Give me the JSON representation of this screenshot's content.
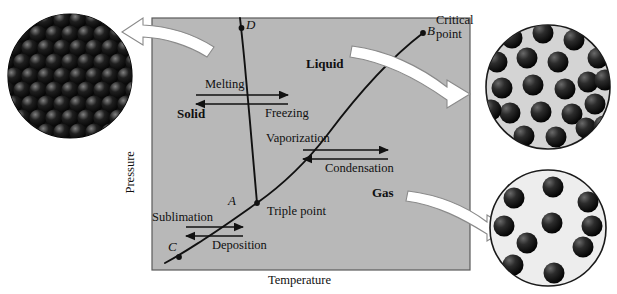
{
  "figure": {
    "kind": "phase-diagram",
    "axes": {
      "x_label": "Temperature",
      "y_label": "Pressure"
    },
    "plot_background_color": "#b8b8b8",
    "plot_border_color": "#555555",
    "curve_color": "#111111",
    "regions": [
      {
        "name": "solid",
        "label": "Solid"
      },
      {
        "name": "liquid",
        "label": "Liquid"
      },
      {
        "name": "gas",
        "label": "Gas"
      }
    ],
    "points": [
      {
        "id": "A",
        "label": "A",
        "annotation": "Triple point"
      },
      {
        "id": "B",
        "label": "B",
        "annotation_line1": "Critical",
        "annotation_line2": "point"
      },
      {
        "id": "C",
        "label": "C",
        "annotation": ""
      },
      {
        "id": "D",
        "label": "D",
        "annotation": ""
      }
    ],
    "processes": [
      {
        "name": "melting",
        "label": "Melting",
        "direction": "right"
      },
      {
        "name": "freezing",
        "label": "Freezing",
        "direction": "left"
      },
      {
        "name": "vaporization",
        "label": "Vaporization",
        "direction": "right"
      },
      {
        "name": "condensation",
        "label": "Condensation",
        "direction": "left"
      },
      {
        "name": "sublimation",
        "label": "Sublimation",
        "direction": "right"
      },
      {
        "name": "deposition",
        "label": "Deposition",
        "direction": "left"
      }
    ],
    "insets": [
      {
        "name": "solid-inset",
        "phase": "solid",
        "particle_count": 78,
        "particle_color": "#1a1a1a",
        "background_color": "#0d0d0d",
        "arrangement": "close-packed-lattice"
      },
      {
        "name": "liquid-inset",
        "phase": "liquid",
        "particle_count": 25,
        "particle_color": "#1a1a1a",
        "background_color": "#d4d4d4",
        "arrangement": "dense-random"
      },
      {
        "name": "gas-inset",
        "phase": "gas",
        "particle_count": 10,
        "particle_color": "#1a1a1a",
        "background_color": "#ededed",
        "arrangement": "sparse-random"
      }
    ],
    "pointer_arrows": [
      {
        "name": "arrow-to-solid-inset",
        "direction": "left",
        "target": "solid-inset"
      },
      {
        "name": "arrow-to-liquid-inset",
        "direction": "right",
        "target": "liquid-inset"
      },
      {
        "name": "arrow-to-gas-inset",
        "direction": "right",
        "target": "gas-inset"
      }
    ]
  }
}
